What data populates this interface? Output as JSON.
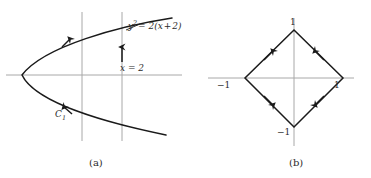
{
  "figure": {
    "width": 371,
    "height": 178,
    "background": "#ffffff",
    "ink_color": "#1a1a1a",
    "axis_color": "#a8a8a8",
    "label_color": "#2b2b2b"
  },
  "panel_a": {
    "caption": "(a)",
    "curve_equation_label": "y² = 2(x + 2)",
    "curve_equation_parts": {
      "lhs_base": "y",
      "lhs_exp": "2",
      "rhs": "= 2(x + 2)"
    },
    "vertical_line_label": "x = 2",
    "curve_name_label": "C",
    "curve_name_subscript": "1",
    "description": "Leftward-opening parabola y squared equals 2 times (x plus 2), crossed by two vertical lines; arrows indicate orientation upward along the parabola and upward along the line x = 2.",
    "axes": {
      "x_axis": true,
      "y_axis": false,
      "horizontal_axis_y": 75
    },
    "vertical_lines": [
      {
        "name": "unlabeled-vertical-line",
        "x": 82
      },
      {
        "name": "line-x-equals-2",
        "x": 122,
        "label": "x = 2"
      }
    ],
    "parabola": {
      "vertex_x": 22,
      "vertex_y": 75,
      "opens": "left",
      "orientation_arrows": 2
    }
  },
  "panel_b": {
    "caption": "(b)",
    "description": "Diamond |x| + |y| = 1 with vertices at (1,0), (0,1), (-1,0), (0,-1); arrows on each edge point toward the vertical vertices.",
    "vertex_labels": {
      "top": "1",
      "bottom": "−1",
      "left": "−1",
      "right": "1"
    },
    "axes": {
      "x_axis": true,
      "y_axis": true
    },
    "vertices": [
      {
        "name": "top-vertex",
        "x": 0,
        "y": 1,
        "label": "1"
      },
      {
        "name": "right-vertex",
        "x": 1,
        "y": 0,
        "label": "1"
      },
      {
        "name": "bottom-vertex",
        "x": 0,
        "y": -1,
        "label": "−1"
      },
      {
        "name": "left-vertex",
        "x": -1,
        "y": 0,
        "label": "−1"
      }
    ],
    "edge_arrows": [
      {
        "name": "upper-left-edge-arrow",
        "direction": "toward-top-vertex"
      },
      {
        "name": "upper-right-edge-arrow",
        "direction": "toward-top-vertex"
      },
      {
        "name": "lower-left-edge-arrow",
        "direction": "toward-bottom-vertex"
      },
      {
        "name": "lower-right-edge-arrow",
        "direction": "toward-bottom-vertex"
      }
    ]
  }
}
